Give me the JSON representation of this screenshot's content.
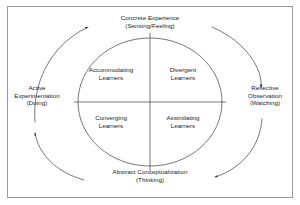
{
  "figure": {
    "kind": "kolb-experiential-learning-cycle",
    "border_color": "#9a9a9a",
    "line_color": "#3a3a3a",
    "text_color": "#1a1a1a",
    "background": "#ffffff"
  },
  "stages": {
    "top": {
      "name": "concrete-experience",
      "title": "Concrete Experience",
      "mode": "(Sensing/Feeling)"
    },
    "right": {
      "name": "reflective-observation",
      "title": "Reflective Observation",
      "title_line1": "Reflective",
      "title_line2": "Observation",
      "mode": "(Watching)"
    },
    "bottom": {
      "name": "abstract-conceptualization",
      "title": "Abstract Conceptualization",
      "mode": "(Thinking)"
    },
    "left": {
      "name": "active-experimentation",
      "title": "Active Experimentation",
      "title_line1": "Active",
      "title_line2": "Experimentation",
      "mode": "(Doing)"
    }
  },
  "quadrants": {
    "top_left": {
      "name": "accommodating-learners",
      "line1": "Accommodating",
      "line2": "Learners"
    },
    "top_right": {
      "name": "divergent-learners",
      "line1": "Divergent",
      "line2": "Learners"
    },
    "bottom_left": {
      "name": "converging-learners",
      "line1": "Converging",
      "line2": "Learners"
    },
    "bottom_right": {
      "name": "assimilating-learners",
      "line1": "Assimilating",
      "line2": "Learners"
    }
  },
  "cycle": {
    "direction": "clockwise",
    "arrow_count": 4,
    "arrow_targets": [
      "concrete-experience",
      "reflective-observation",
      "abstract-conceptualization",
      "active-experimentation"
    ]
  }
}
